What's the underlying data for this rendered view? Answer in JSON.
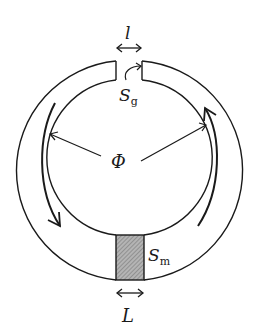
{
  "diagram": {
    "type": "magnetic-circuit",
    "labels": {
      "gap_length": "l",
      "gap_area_main": "S",
      "gap_area_sub": "g",
      "flux": "Φ",
      "magnet_area_main": "S",
      "magnet_area_sub": "m",
      "magnet_length": "L"
    },
    "colors": {
      "stroke": "#1a1a1a",
      "magnet_fill": "#9a9a9a",
      "background": "#ffffff"
    }
  }
}
